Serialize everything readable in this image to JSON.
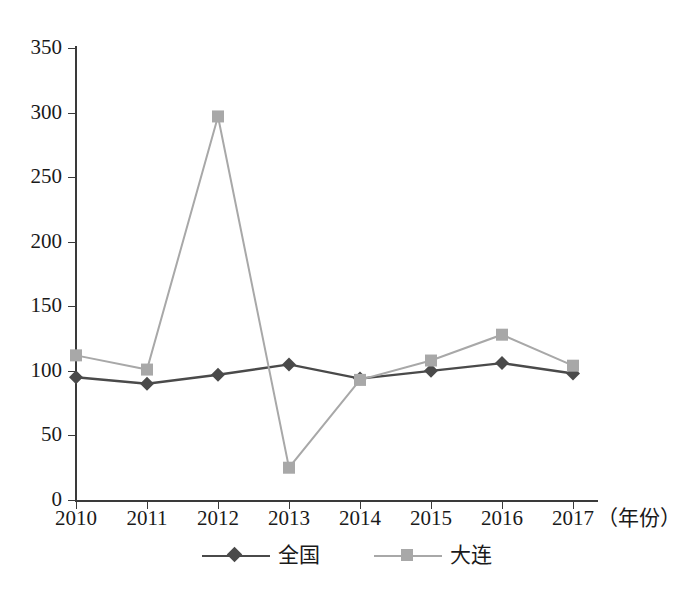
{
  "chart_data": {
    "type": "line",
    "title": "",
    "subtitle": "",
    "xlabel": "（年份）",
    "ylabel": "",
    "categories": [
      "2010",
      "2011",
      "2012",
      "2013",
      "2014",
      "2015",
      "2016",
      "2017"
    ],
    "x": [
      2010,
      2011,
      2012,
      2013,
      2014,
      2015,
      2016,
      2017
    ],
    "series": [
      {
        "name": "全国",
        "color": "#4a4a4a",
        "marker": "diamond",
        "values": [
          95,
          90,
          97,
          105,
          94,
          100,
          106,
          98
        ]
      },
      {
        "name": "大连",
        "color": "#a8a8a8",
        "marker": "square",
        "values": [
          112,
          101,
          297,
          25,
          93,
          108,
          128,
          104
        ]
      }
    ],
    "ylim": [
      0,
      350
    ],
    "yticks": [
      0,
      50,
      100,
      150,
      200,
      250,
      300,
      350
    ],
    "ytick_labels": [
      "0",
      "50",
      "100",
      "150",
      "200",
      "250",
      "300",
      "350"
    ],
    "grid": false,
    "legend_position": "bottom"
  },
  "axes": {
    "y_tick_labels": [
      "350",
      "300",
      "250",
      "200",
      "150",
      "100",
      "50",
      "0"
    ],
    "x_tick_labels": [
      "2010",
      "2011",
      "2012",
      "2013",
      "2014",
      "2015",
      "2016",
      "2017"
    ],
    "x_unit_label": "（年份）"
  },
  "legend": {
    "items": [
      {
        "label": "全国",
        "color": "#4a4a4a",
        "marker": "diamond"
      },
      {
        "label": "大连",
        "color": "#a8a8a8",
        "marker": "square"
      }
    ]
  },
  "colors": {
    "national_line": "#4a4a4a",
    "dalian_line": "#a8a8a8",
    "axis": "#3a3a3a",
    "text": "#1a1a1a",
    "background": "#ffffff"
  }
}
